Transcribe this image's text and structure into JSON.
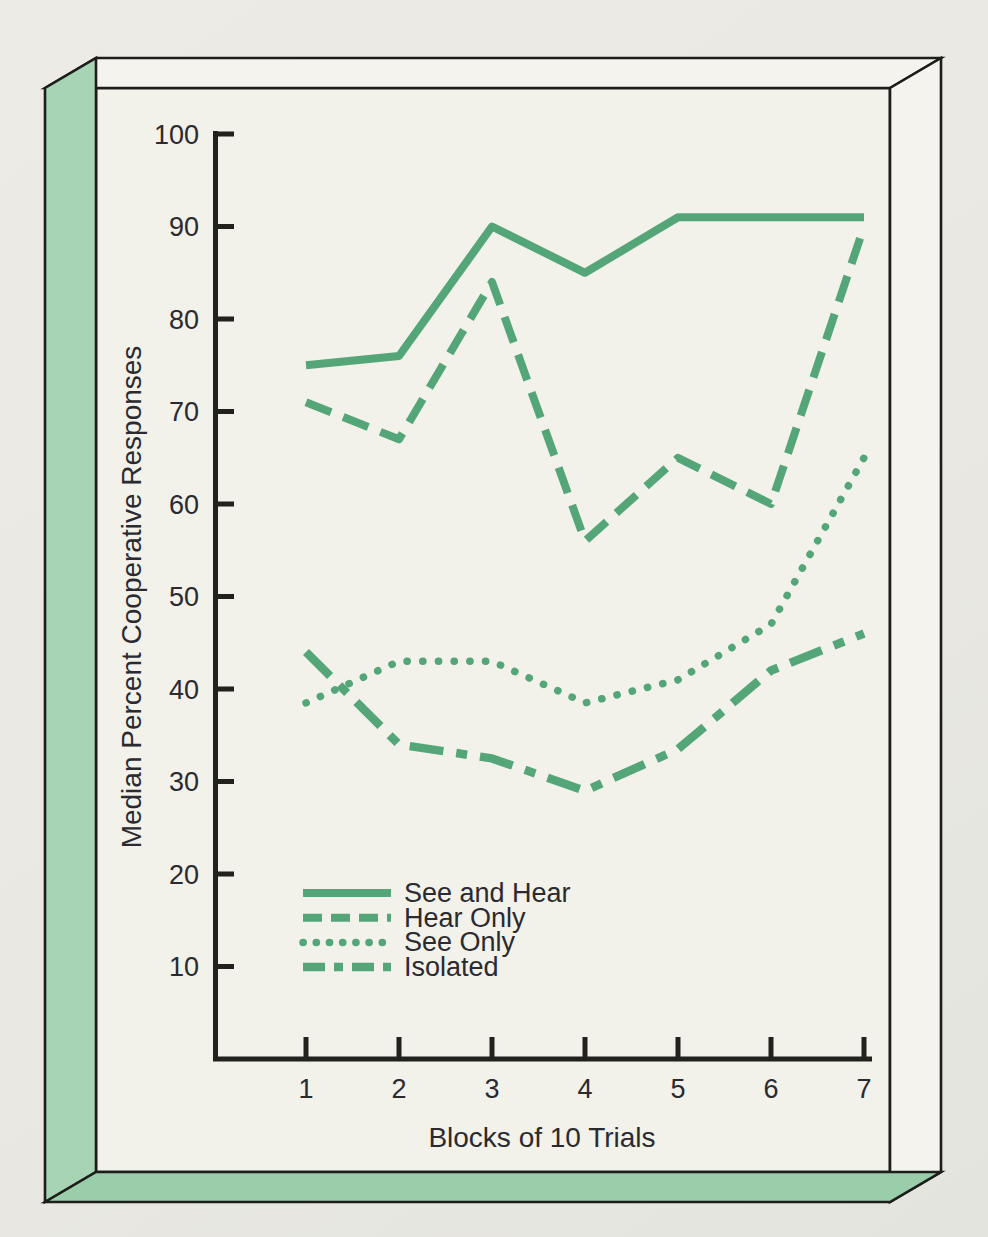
{
  "figure": {
    "kind": "scanned-textbook-line-chart",
    "caption_visible": false
  },
  "colors": {
    "page_background": "#e9e8e2",
    "panel_background": "#f2f1ea",
    "frame_face_light": "#f4f3ee",
    "frame_green_left": "#a7d4b5",
    "frame_green_bottom": "#9acdaa",
    "outline_black": "#1d1d1b",
    "axis_color": "#21211e",
    "text_color": "#2a2a30",
    "line_green": "#54a678"
  },
  "chart_data": {
    "type": "line",
    "title": "",
    "xlabel": "Blocks of 10 Trials",
    "ylabel": "Median Percent Cooperative Responses",
    "x": [
      1,
      2,
      3,
      4,
      5,
      6,
      7
    ],
    "xticks": [
      1,
      2,
      3,
      4,
      5,
      6,
      7
    ],
    "yticks": [
      100,
      90,
      80,
      70,
      60,
      50,
      40,
      30,
      20,
      10
    ],
    "ylim": [
      0,
      100
    ],
    "xlim": [
      0,
      7.2
    ],
    "grid": false,
    "legend_position": "inside-lower-left",
    "line_color": "#54a678",
    "series": [
      {
        "name": "See and Hear",
        "style": "solid",
        "values": [
          75,
          76,
          90,
          85,
          91,
          91,
          91
        ]
      },
      {
        "name": "Hear Only",
        "style": "dashed",
        "values": [
          71,
          67,
          84,
          56,
          65,
          60,
          90
        ]
      },
      {
        "name": "See Only",
        "style": "dotted",
        "values": [
          38.5,
          43,
          43,
          38.5,
          41,
          47,
          65
        ]
      },
      {
        "name": "Isolated",
        "style": "dash-dot",
        "values": [
          44,
          34,
          32.5,
          29,
          33.5,
          42,
          46
        ]
      }
    ]
  }
}
